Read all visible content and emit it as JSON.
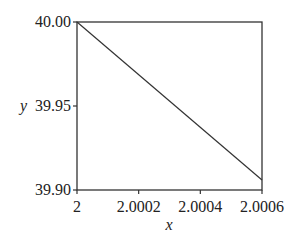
{
  "chart_data": {
    "type": "line",
    "title": "",
    "xlabel": "x",
    "ylabel": "y",
    "xlim": [
      2.0,
      2.0006
    ],
    "ylim": [
      39.9,
      40.0
    ],
    "x_ticks": [
      "2",
      "2.0002",
      "2.0004",
      "2.0006"
    ],
    "y_ticks": [
      "39.90",
      "39.95",
      "40.00"
    ],
    "grid": false,
    "legend": null,
    "series": [
      {
        "name": "y",
        "x": [
          2.0,
          2.0006
        ],
        "y": [
          40.0,
          39.906
        ]
      }
    ]
  },
  "frame": {
    "left": 77,
    "top": 22,
    "right": 262,
    "bottom": 190
  }
}
